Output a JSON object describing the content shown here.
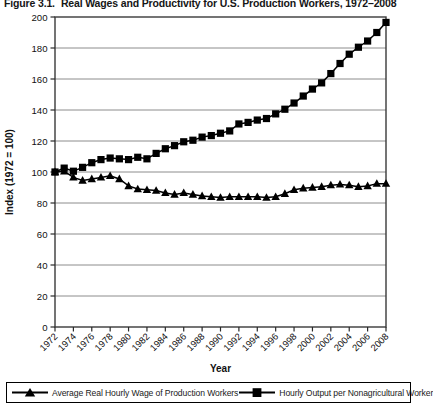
{
  "figure": {
    "caption_number": "Figure 3.1.",
    "caption_text": "Real Wages and Productivity for U.S. Production Workers, 1972–2008"
  },
  "legend": {
    "position": "bottom",
    "items": [
      {
        "label": "Average Real Hourly Wage of Production Workers",
        "marker": "triangle-marker-icon",
        "color": "#000000"
      },
      {
        "label": "Hourly Output per Nonagricultural Worker",
        "marker": "square-marker-icon",
        "color": "#000000"
      }
    ]
  },
  "chart_data": {
    "type": "line",
    "title": "Real Wages and Productivity for U.S. Production Workers, 1972–2008",
    "xlabel": "Year",
    "ylabel": "Index (1972 = 100)",
    "xlim": [
      1972,
      2008
    ],
    "ylim": [
      0,
      200
    ],
    "ytick_step": 20,
    "yticks": [
      0,
      20,
      40,
      60,
      80,
      100,
      120,
      140,
      160,
      180,
      200
    ],
    "ytick_labels": [
      "0",
      "20",
      "40",
      "60",
      "80",
      "100",
      "120",
      "140",
      "160",
      "180",
      "200"
    ],
    "xticks": [
      1972,
      1974,
      1976,
      1978,
      1980,
      1982,
      1984,
      1986,
      1988,
      1990,
      1992,
      1994,
      1996,
      1998,
      2000,
      2002,
      2004,
      2006,
      2008
    ],
    "xtick_labels": [
      "1972",
      "1974",
      "1976",
      "1978",
      "1980",
      "1982",
      "1984",
      "1986",
      "1988",
      "1990",
      "1992",
      "1994",
      "1996",
      "1998",
      "2000",
      "2002",
      "2004",
      "2006",
      "2008"
    ],
    "xtick_rotation": 45,
    "grid": "horizontal",
    "grid_color": "#808080",
    "plot_border": true,
    "x": [
      1972,
      1973,
      1974,
      1975,
      1976,
      1977,
      1978,
      1979,
      1980,
      1981,
      1982,
      1983,
      1984,
      1985,
      1986,
      1987,
      1988,
      1989,
      1990,
      1991,
      1992,
      1993,
      1994,
      1995,
      1996,
      1997,
      1998,
      1999,
      2000,
      2001,
      2002,
      2003,
      2004,
      2005,
      2006,
      2007,
      2008
    ],
    "series": [
      {
        "name": "Average Real Hourly Wage of Production Workers",
        "marker": "triangle",
        "color": "#000000",
        "values": [
          100,
          100.5,
          96.5,
          94.5,
          95.5,
          96.5,
          97.5,
          95.5,
          91.0,
          89.0,
          88.5,
          88.0,
          86.5,
          85.5,
          86.5,
          85.5,
          84.5,
          84.0,
          83.5,
          84.0,
          84.0,
          84.0,
          84.0,
          83.5,
          84.0,
          86.0,
          88.5,
          89.5,
          90.0,
          90.5,
          91.5,
          92.0,
          91.5,
          90.5,
          91.0,
          92.5,
          92.5
        ]
      },
      {
        "name": "Hourly Output per Nonagricultural Worker",
        "marker": "square",
        "color": "#000000",
        "values": [
          100,
          102.5,
          100.5,
          103.0,
          106.0,
          108.0,
          109.0,
          108.5,
          108.0,
          109.5,
          108.5,
          112.0,
          115.0,
          117.0,
          119.5,
          120.5,
          122.5,
          123.5,
          125.0,
          126.5,
          131.0,
          132.0,
          133.5,
          134.5,
          137.5,
          140.5,
          144.5,
          149.0,
          153.5,
          157.5,
          163.5,
          170.0,
          176.0,
          180.5,
          184.5,
          190.0,
          196.5
        ]
      }
    ]
  }
}
